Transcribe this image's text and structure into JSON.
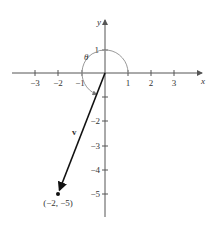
{
  "diagram": {
    "type": "vector-plane",
    "axes": {
      "x_label": "x",
      "y_label": "y",
      "x_ticks": [
        "−3",
        "−2",
        "−1",
        "1",
        "2",
        "3"
      ],
      "y_ticks_positive": [
        "1"
      ],
      "y_ticks_negative": [
        "−1",
        "−2",
        "−3",
        "−4",
        "−5"
      ],
      "y_tick_labels_shown": [
        "1",
        "−2",
        "−3",
        "−4",
        "−5"
      ]
    },
    "vector": {
      "label": "v",
      "from": [
        0,
        0
      ],
      "to": [
        -2,
        -5
      ],
      "endpoint_label": "(−2, −5)"
    },
    "angle": {
      "label": "θ",
      "description": "arc from positive x-axis counterclockwise to vector v"
    },
    "colors": {
      "axis": "#555555",
      "vector": "#111111",
      "arc": "#999999",
      "text": "#333333"
    }
  }
}
